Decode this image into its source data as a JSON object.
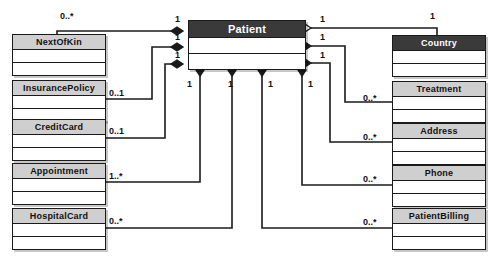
{
  "diagram": {
    "type": "uml-class-diagram",
    "colors": {
      "header_dark_bg": "#3a3a3a",
      "header_dark_text": "#ffffff",
      "header_light_bg": "#cfcfcf",
      "header_light_text": "#111111",
      "line": "#1a1a1a",
      "body_bg": "#ffffff",
      "canvas_bg": "#ffffff"
    },
    "classes": [
      {
        "id": "patient",
        "name": "Patient",
        "header_style": "dark",
        "x": 188,
        "y": 20,
        "w": 118,
        "h": 50,
        "name_h": 17,
        "compartments": 2
      },
      {
        "id": "nextofkin",
        "name": "NextOfKin",
        "header_style": "light",
        "x": 12,
        "y": 34,
        "w": 94,
        "h": 42,
        "name_h": 15,
        "compartments": 2
      },
      {
        "id": "insurancepolicy",
        "name": "InsurancePolicy",
        "header_style": "light",
        "x": 12,
        "y": 80,
        "w": 94,
        "h": 42,
        "name_h": 15,
        "compartments": 2
      },
      {
        "id": "creditcard",
        "name": "CreditCard",
        "header_style": "light",
        "x": 12,
        "y": 119,
        "w": 94,
        "h": 42,
        "name_h": 15,
        "compartments": 2
      },
      {
        "id": "appointment",
        "name": "Appointment",
        "header_style": "light",
        "x": 12,
        "y": 163,
        "w": 94,
        "h": 42,
        "name_h": 15,
        "compartments": 2
      },
      {
        "id": "hospitalcard",
        "name": "HospitalCard",
        "header_style": "light",
        "x": 12,
        "y": 208,
        "w": 94,
        "h": 42,
        "name_h": 15,
        "compartments": 2
      },
      {
        "id": "country",
        "name": "Country",
        "header_style": "dark",
        "x": 392,
        "y": 35,
        "w": 94,
        "h": 42,
        "name_h": 15,
        "compartments": 2
      },
      {
        "id": "treatment",
        "name": "Treatment",
        "header_style": "light",
        "x": 392,
        "y": 81,
        "w": 94,
        "h": 42,
        "name_h": 15,
        "compartments": 2
      },
      {
        "id": "address",
        "name": "Address",
        "header_style": "light",
        "x": 392,
        "y": 123,
        "w": 94,
        "h": 42,
        "name_h": 15,
        "compartments": 2
      },
      {
        "id": "phone",
        "name": "Phone",
        "header_style": "light",
        "x": 392,
        "y": 165,
        "w": 94,
        "h": 42,
        "name_h": 15,
        "compartments": 2
      },
      {
        "id": "patientbilling",
        "name": "PatientBilling",
        "header_style": "light",
        "x": 392,
        "y": 208,
        "w": 94,
        "h": 42,
        "name_h": 15,
        "compartments": 2
      }
    ],
    "associations": [
      {
        "id": "patient-nextofkin",
        "from": "patient",
        "to": "nextofkin",
        "diamond": "filled",
        "diamond_side": "left",
        "patient_multiplicity": "1",
        "other_multiplicity": "0..*",
        "patient_label_pos": {
          "x": 175,
          "y": 15
        },
        "other_label_pos": {
          "x": 60,
          "y": 12
        },
        "path": "M 183,31 L 57,31 L 57,34"
      },
      {
        "id": "patient-insurancepolicy",
        "from": "patient",
        "to": "insurancepolicy",
        "diamond": "filled",
        "diamond_side": "left",
        "patient_multiplicity": "1",
        "other_multiplicity": "0..1",
        "patient_label_pos": {
          "x": 175,
          "y": 33
        },
        "other_label_pos": {
          "x": 109,
          "y": 89
        },
        "path": "M 183,47 L 152,47 L 152,99 L 106,99"
      },
      {
        "id": "patient-creditcard",
        "from": "patient",
        "to": "creditcard",
        "diamond": "filled",
        "diamond_side": "left",
        "patient_multiplicity": "1",
        "other_multiplicity": "0..1",
        "patient_label_pos": {
          "x": 175,
          "y": 51
        },
        "other_label_pos": {
          "x": 109,
          "y": 127
        },
        "path": "M 183,64 L 165,64 L 165,138 L 106,138"
      },
      {
        "id": "patient-appointment",
        "from": "patient",
        "to": "appointment",
        "diamond": "filled",
        "diamond_side": "bottom",
        "patient_multiplicity": "1",
        "other_multiplicity": "1..*",
        "patient_label_pos": {
          "x": 187,
          "y": 80
        },
        "other_label_pos": {
          "x": 109,
          "y": 172
        },
        "path": "M 200,76 L 200,182 L 106,182"
      },
      {
        "id": "patient-hospitalcard",
        "from": "patient",
        "to": "hospitalcard",
        "diamond": "filled",
        "diamond_side": "bottom",
        "patient_multiplicity": "1",
        "other_multiplicity": "0..*",
        "patient_label_pos": {
          "x": 228,
          "y": 80
        },
        "other_label_pos": {
          "x": 109,
          "y": 217
        },
        "path": "M 232,76 L 232,228 L 106,228"
      },
      {
        "id": "patient-country",
        "from": "patient",
        "to": "country",
        "diamond": "hollow",
        "diamond_side": "right",
        "patient_multiplicity": "1",
        "other_multiplicity": "1",
        "patient_label_pos": {
          "x": 320,
          "y": 15
        },
        "other_label_pos": {
          "x": 430,
          "y": 12
        },
        "path": "M 311,28 L 437,28 L 437,35"
      },
      {
        "id": "patient-treatment",
        "from": "patient",
        "to": "treatment",
        "diamond": "filled",
        "diamond_side": "right",
        "patient_multiplicity": "1",
        "other_multiplicity": "0..*",
        "patient_label_pos": {
          "x": 320,
          "y": 33
        },
        "other_label_pos": {
          "x": 363,
          "y": 94
        },
        "path": "M 311,46 L 345,46 L 345,102 L 392,102"
      },
      {
        "id": "patient-address",
        "from": "patient",
        "to": "address",
        "diamond": "filled",
        "diamond_side": "right",
        "patient_multiplicity": "1",
        "other_multiplicity": "0..*",
        "patient_label_pos": {
          "x": 320,
          "y": 51
        },
        "other_label_pos": {
          "x": 363,
          "y": 133
        },
        "path": "M 311,63 L 330,63 L 330,142 L 392,142"
      },
      {
        "id": "patient-phone",
        "from": "patient",
        "to": "phone",
        "diamond": "filled",
        "diamond_side": "bottom",
        "patient_multiplicity": "1",
        "other_multiplicity": "0..*",
        "patient_label_pos": {
          "x": 308,
          "y": 80
        },
        "other_label_pos": {
          "x": 363,
          "y": 175
        },
        "path": "M 302,76 L 302,185 L 392,185"
      },
      {
        "id": "patient-patientbilling",
        "from": "patient",
        "to": "patientbilling",
        "diamond": "filled",
        "diamond_side": "bottom",
        "patient_multiplicity": "1",
        "other_multiplicity": "0..*",
        "patient_label_pos": {
          "x": 268,
          "y": 80
        },
        "other_label_pos": {
          "x": 363,
          "y": 218
        },
        "path": "M 262,76 L 262,228 L 392,228"
      }
    ],
    "diamonds": [
      {
        "id": "d-left-1",
        "style": "filled",
        "x": 183,
        "y": 31,
        "angle": 0
      },
      {
        "id": "d-left-2",
        "style": "filled",
        "x": 183,
        "y": 47,
        "angle": 0
      },
      {
        "id": "d-left-3",
        "style": "filled",
        "x": 183,
        "y": 64,
        "angle": 0
      },
      {
        "id": "d-right-1",
        "style": "hollow",
        "x": 311,
        "y": 28,
        "angle": 0
      },
      {
        "id": "d-right-2",
        "style": "filled",
        "x": 311,
        "y": 46,
        "angle": 0
      },
      {
        "id": "d-right-3",
        "style": "filled",
        "x": 311,
        "y": 63,
        "angle": 0
      },
      {
        "id": "d-bottom-1",
        "style": "filled",
        "x": 200,
        "y": 76,
        "angle": 90
      },
      {
        "id": "d-bottom-2",
        "style": "filled",
        "x": 232,
        "y": 76,
        "angle": 90
      },
      {
        "id": "d-bottom-3",
        "style": "filled",
        "x": 262,
        "y": 76,
        "angle": 90
      },
      {
        "id": "d-bottom-4",
        "style": "filled",
        "x": 302,
        "y": 76,
        "angle": 90
      }
    ]
  }
}
